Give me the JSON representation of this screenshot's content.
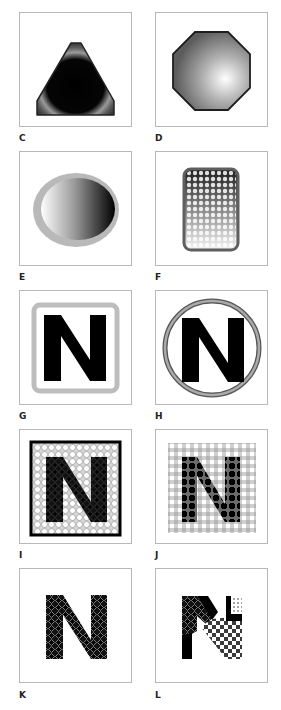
{
  "figure": {
    "panels": [
      {
        "id": "C",
        "label": "C",
        "shape": "triangle",
        "fill": "radial dark-gray inner glow",
        "stroke": "#2a2a2a"
      },
      {
        "id": "D",
        "label": "D",
        "shape": "octagon",
        "fill": "radial gradient highlight lower-right",
        "stroke": "#222222"
      },
      {
        "id": "E",
        "label": "E",
        "shape": "ellipse",
        "fill": "linear gradient white to black",
        "stroke": "#b5b5b5"
      },
      {
        "id": "F",
        "label": "F",
        "shape": "rounded-rectangle",
        "fill": "halftone dot gradient",
        "stroke": "#5f5f5f"
      },
      {
        "id": "G",
        "label": "G",
        "shape": "letter-N-in-rounded-square",
        "letter": "N",
        "stroke": "#bdbdbd"
      },
      {
        "id": "H",
        "label": "H",
        "shape": "letter-N-in-circle",
        "letter": "N",
        "stroke": "#666666"
      },
      {
        "id": "I",
        "label": "I",
        "shape": "letter-N-circle-pattern-square",
        "letter": "N",
        "stroke": "#111111"
      },
      {
        "id": "J",
        "label": "J",
        "shape": "letter-N-grid-pattern",
        "letter": "N"
      },
      {
        "id": "K",
        "label": "K",
        "shape": "letter-N-diamond-pattern",
        "letter": "N"
      },
      {
        "id": "L",
        "label": "L",
        "shape": "letter-N-mixed-pattern",
        "letter": "N"
      }
    ]
  }
}
